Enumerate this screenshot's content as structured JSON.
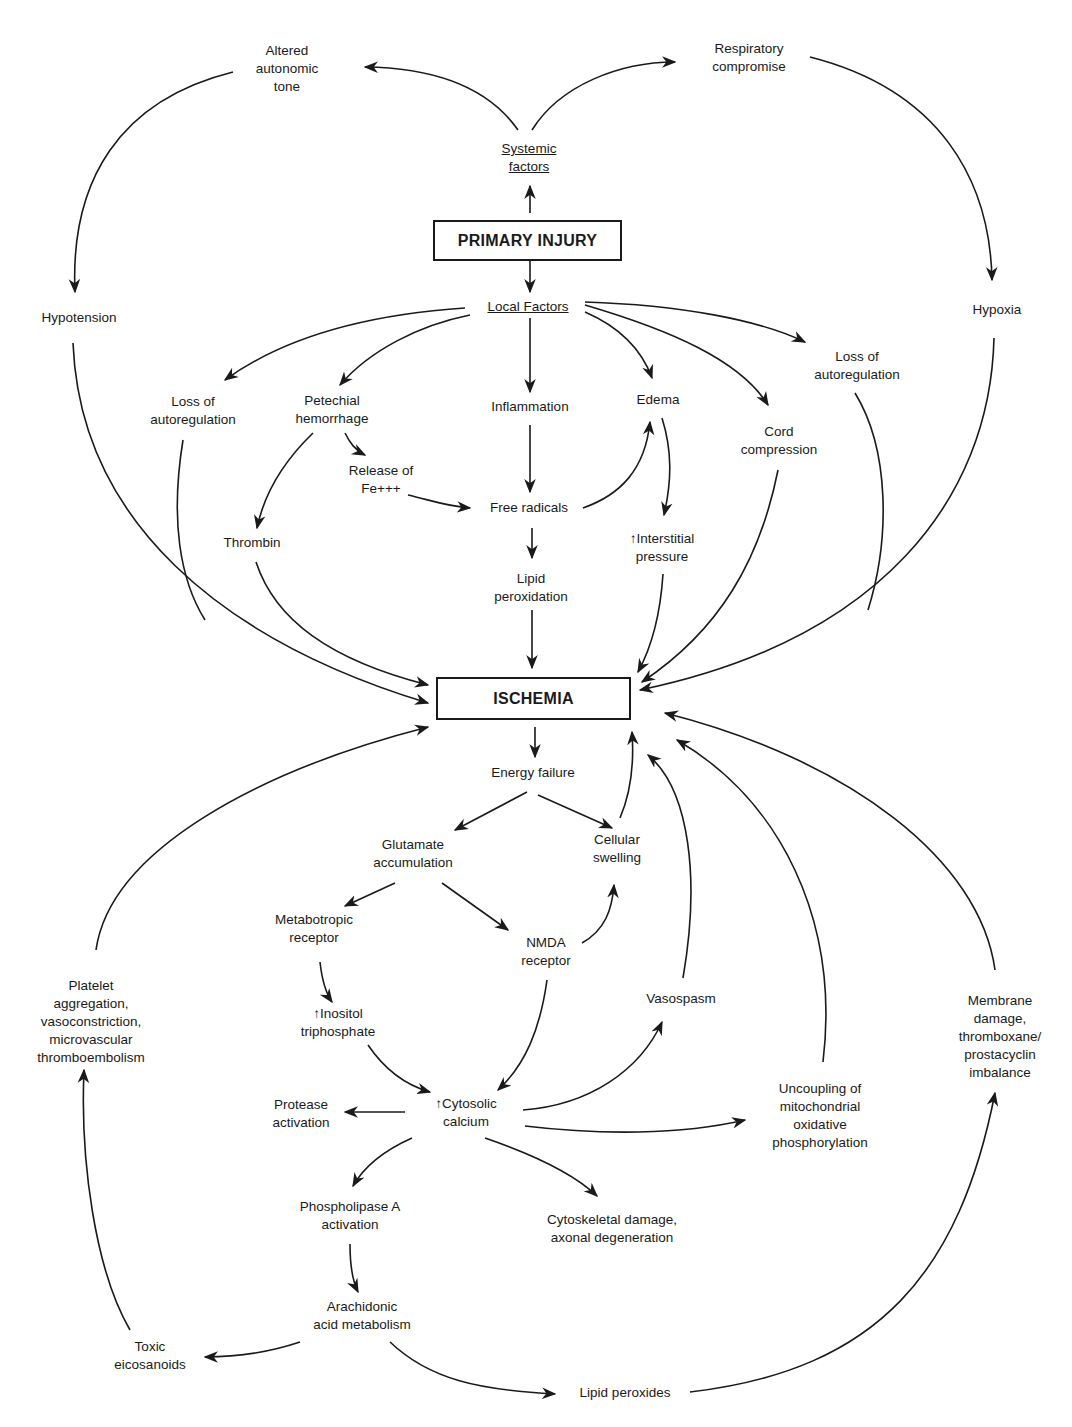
{
  "diagram": {
    "boxes": {
      "primary_injury": "PRIMARY INJURY",
      "ischemia": "ISCHEMIA"
    },
    "nodes": {
      "systemic_factors": [
        "Systemic",
        "factors"
      ],
      "local_factors": [
        "Local Factors"
      ],
      "altered_autonomic_tone": [
        "Altered",
        "autonomic",
        "tone"
      ],
      "respiratory_compromise": [
        "Respiratory",
        "compromise"
      ],
      "hypotension": [
        "Hypotension"
      ],
      "hypoxia": [
        "Hypoxia"
      ],
      "loss_autoreg_left": [
        "Loss of",
        "autoregulation"
      ],
      "petechial_hemorrhage": [
        "Petechial",
        "hemorrhage"
      ],
      "inflammation": [
        "Inflammation"
      ],
      "edema": [
        "Edema"
      ],
      "cord_compression": [
        "Cord",
        "compression"
      ],
      "loss_autoreg_right": [
        "Loss of",
        "autoregulation"
      ],
      "release_fe": [
        "Release of",
        "Fe+++"
      ],
      "thrombin": [
        "Thrombin"
      ],
      "free_radicals": [
        "Free radicals"
      ],
      "interstitial_pressure": [
        "↑Interstitial",
        "pressure"
      ],
      "lipid_peroxidation": [
        "Lipid",
        "peroxidation"
      ],
      "energy_failure": [
        "Energy failure"
      ],
      "glutamate_accumulation": [
        "Glutamate",
        "accumulation"
      ],
      "cellular_swelling": [
        "Cellular",
        "swelling"
      ],
      "metabotropic_receptor": [
        "Metabotropic",
        "receptor"
      ],
      "nmda_receptor": [
        "NMDA",
        "receptor"
      ],
      "inositol_triphosphate": [
        "↑Inositol",
        "triphosphate"
      ],
      "vasospasm": [
        "Vasospasm"
      ],
      "platelet_aggregation": [
        "Platelet",
        "aggregation,",
        "vasoconstriction,",
        "microvascular",
        "thromboembolism"
      ],
      "membrane_damage": [
        "Membrane",
        "damage,",
        "thromboxane/",
        "prostacyclin",
        "imbalance"
      ],
      "cytosolic_calcium": [
        "↑Cytosolic",
        "calcium"
      ],
      "protease_activation": [
        "Protease",
        "activation"
      ],
      "uncoupling": [
        "Uncoupling of",
        "mitochondrial",
        "oxidative",
        "phosphorylation"
      ],
      "phospholipase_a": [
        "Phospholipase A",
        "activation"
      ],
      "cytoskeletal_damage": [
        "Cytoskeletal damage,",
        "axonal degeneration"
      ],
      "arachidonic_acid": [
        "Arachidonic",
        "acid metabolism"
      ],
      "toxic_eicosanoids": [
        "Toxic",
        "eicosanoids"
      ],
      "lipid_peroxides": [
        "Lipid peroxides"
      ]
    },
    "colors": {
      "ink": "#1a1a1a",
      "background": "#ffffff"
    }
  }
}
